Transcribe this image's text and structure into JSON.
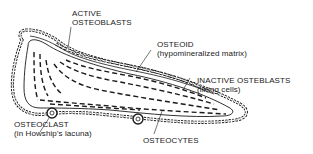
{
  "diagram": {
    "colors": {
      "ink": "#1a1a1a",
      "background": "#ffffff"
    },
    "labels": {
      "active_osteoblasts": {
        "line1": "ACTIVE",
        "line2": "OSTEOBLASTS"
      },
      "osteoid": {
        "line1": "OSTEOID",
        "line2": "(hypomineralized matrix)"
      },
      "inactive_osteoblasts": {
        "line1": "INACTIVE OSTEBLASTS",
        "line2": "(lining cells)"
      },
      "osteoclast": {
        "line1": "OSTEOCLAST",
        "line2": "(in Howship's lacuna)"
      },
      "osteocytes": {
        "line1": "OSTEOCYTES"
      }
    }
  }
}
